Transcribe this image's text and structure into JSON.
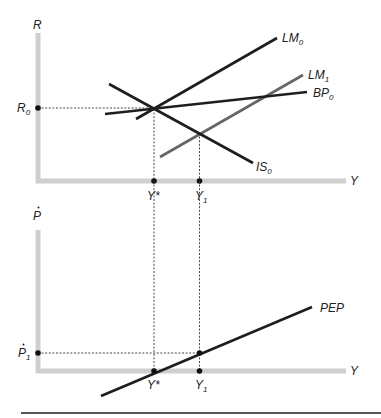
{
  "colors": {
    "axis": "#cfcfcf",
    "curve": "#1e1e1e",
    "shifted_curve": "#666666",
    "guide": "#333333",
    "separator": "#555555"
  },
  "top_panel": {
    "y_axis_label": "R",
    "x_axis_label": "Y",
    "r0_label": {
      "main": "R",
      "sub": "0"
    },
    "ystar_label": "Y*",
    "y1_label": {
      "main": "Y",
      "sub": "1"
    },
    "curves": [
      {
        "id": "LM0",
        "main": "LM",
        "sub": "0",
        "x1": 136,
        "y1": 119,
        "x2": 277,
        "y2": 38,
        "color": "#1e1e1e",
        "lx": 282,
        "ly": 42
      },
      {
        "id": "LM1",
        "main": "LM",
        "sub": "1",
        "x1": 160,
        "y1": 157,
        "x2": 303,
        "y2": 75,
        "color": "#666666",
        "lx": 308,
        "ly": 79
      },
      {
        "id": "BP0",
        "main": "BP",
        "sub": "0",
        "x1": 105,
        "y1": 114,
        "x2": 307,
        "y2": 92,
        "color": "#1e1e1e",
        "lx": 313,
        "ly": 97
      },
      {
        "id": "IS0",
        "main": "IS",
        "sub": "0",
        "x1": 109,
        "y1": 84,
        "x2": 253,
        "y2": 163,
        "color": "#1e1e1e",
        "lx": 256,
        "ly": 171
      }
    ]
  },
  "bottom_panel": {
    "y_axis_label": "P",
    "x_axis_label": "Y",
    "p1_label": {
      "main": "P",
      "sub": "1"
    },
    "ystar_label": "Y*",
    "y1_label": {
      "main": "Y",
      "sub": "1"
    },
    "curves": [
      {
        "id": "PEP",
        "main": "PEP",
        "sub": "",
        "x1": 101,
        "y1": 396,
        "x2": 312,
        "y2": 307,
        "color": "#1e1e1e",
        "lx": 320,
        "ly": 312
      }
    ]
  }
}
